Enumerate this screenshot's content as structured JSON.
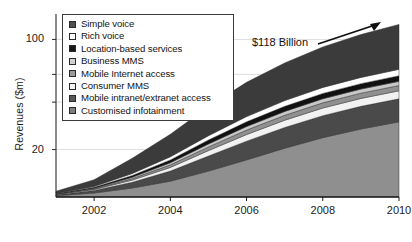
{
  "chart_data": {
    "type": "area",
    "title": "",
    "subtitle": "",
    "xlabel": "",
    "ylabel": "Revenues ($m)",
    "stacked": true,
    "yscale": "log",
    "ylim": [
      10,
      145
    ],
    "xlim": [
      2001,
      2010
    ],
    "grid": true,
    "grid_axis": "y",
    "legend_position": "top-left",
    "x": [
      2001,
      2002,
      2003,
      2004,
      2005,
      2006,
      2007,
      2008,
      2009,
      2010
    ],
    "categories": [
      "2001",
      "2002",
      "2003",
      "2004",
      "2005",
      "2006",
      "2007",
      "2008",
      "2009",
      "2010"
    ],
    "xticks": [
      2002,
      2004,
      2006,
      2008,
      2010
    ],
    "xticklabels": [
      "2002",
      "2004",
      "2006",
      "2008",
      "2010"
    ],
    "yticks": [
      20,
      100
    ],
    "yticklabels": [
      "20",
      "100"
    ],
    "gridlines": [
      20,
      40,
      60,
      100
    ],
    "series": [
      {
        "name": "Customised infotainment",
        "color": "#8f8f8f",
        "values": [
          10.2,
          10.6,
          11.4,
          12.6,
          14.6,
          17.2,
          20.4,
          23.8,
          27.0,
          30.0
        ]
      },
      {
        "name": "Mobile intranet/extranet access",
        "color": "#4a4a4a",
        "values": [
          0.15,
          0.4,
          1.0,
          2.0,
          3.6,
          5.4,
          7.2,
          9.0,
          10.6,
          12.0
        ]
      },
      {
        "name": "Consumer MMS",
        "color": "#f2f2f2",
        "values": [
          0.05,
          0.15,
          0.4,
          0.8,
          1.5,
          2.3,
          3.1,
          3.9,
          4.6,
          5.2
        ]
      },
      {
        "name": "Mobile Internet access",
        "color": "#909090",
        "values": [
          0.04,
          0.12,
          0.3,
          0.6,
          1.1,
          1.7,
          2.3,
          2.9,
          3.4,
          3.8
        ]
      },
      {
        "name": "Business MMS",
        "color": "#c8c8c8",
        "values": [
          0.04,
          0.1,
          0.25,
          0.5,
          0.9,
          1.4,
          1.9,
          2.4,
          2.8,
          3.2
        ]
      },
      {
        "name": "Location-based services",
        "color": "#111111",
        "values": [
          0.05,
          0.15,
          0.35,
          0.7,
          1.3,
          2.0,
          2.7,
          3.4,
          4.0,
          4.6
        ]
      },
      {
        "name": "Rich voice",
        "color": "#ffffff",
        "values": [
          0.05,
          0.15,
          0.4,
          0.8,
          1.5,
          2.4,
          3.3,
          4.2,
          5.0,
          5.8
        ]
      },
      {
        "name": "Simple voice",
        "color": "#3b3b3b",
        "values": [
          0.3,
          1.2,
          3.5,
          7.0,
          13.0,
          21.0,
          30.0,
          40.0,
          50.0,
          60.0
        ]
      }
    ],
    "annotations": [
      {
        "text": "$118 Billion",
        "x": 2008.0,
        "y": 118,
        "arrow": true
      }
    ],
    "total_2010_label": "$118 Billion"
  },
  "legend": {
    "items": [
      {
        "label": "Simple voice",
        "swatch": "#4f4f4f"
      },
      {
        "label": "Rich voice",
        "swatch": "#ffffff"
      },
      {
        "label": "Location-based services",
        "swatch": "#171717"
      },
      {
        "label": "Business MMS",
        "swatch": "#cfcfcf"
      },
      {
        "label": "Mobile Internet access",
        "swatch": "#9a9a9a"
      },
      {
        "label": "Consumer MMS",
        "swatch": "#f4f4f4"
      },
      {
        "label": "Mobile intranet/extranet access",
        "swatch": "#585858"
      },
      {
        "label": "Customised infotainment",
        "swatch": "#7d7d7d"
      }
    ]
  }
}
